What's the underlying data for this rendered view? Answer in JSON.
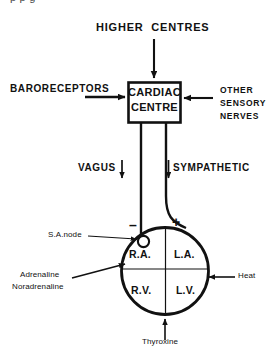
{
  "figure": {
    "type": "flow-diagram",
    "truncated_caption_top": "p   p        g       ",
    "bg_color": "#ffffff",
    "ink_color": "#111111"
  },
  "nodes": {
    "higher_centres": "HIGHER  CENTRES",
    "baroreceptors": "BARORECEPTORS",
    "cardiac_centre_line1": "CARDIAC",
    "cardiac_centre_line2": "CENTRE",
    "other_sensory_1": "OTHER",
    "other_sensory_2": "SENSORY",
    "other_sensory_3": "NERVES",
    "vagus": "VAGUS",
    "sympathetic": "SYMPATHETIC",
    "sa_node": "S.A.node",
    "minus_sign": "–",
    "plus_sign": "+",
    "adrenaline": "Adrenaline",
    "noradrenaline": "Noradrenaline",
    "heat": "Heat",
    "thyroxine": "Thyroxine"
  },
  "heart_chambers": [
    {
      "id": "right-atrium",
      "label": "R.A."
    },
    {
      "id": "left-atrium",
      "label": "L.A."
    },
    {
      "id": "right-ventricle",
      "label": "R.V."
    },
    {
      "id": "left-ventricle",
      "label": "L.V."
    }
  ]
}
